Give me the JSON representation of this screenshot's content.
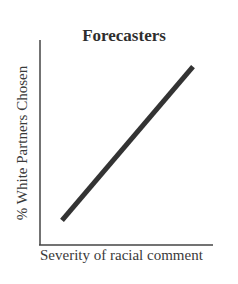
{
  "chart_data": {
    "type": "line",
    "title": "Forecasters",
    "xlabel": "Severity of racial comment",
    "ylabel": "% White Partners Chosen",
    "grid": false,
    "legend": null,
    "x": [
      0,
      1
    ],
    "series": [
      {
        "name": "Forecasters",
        "values": [
          0.12,
          0.87
        ]
      }
    ],
    "xlim": [
      0,
      1
    ],
    "ylim": [
      0,
      1
    ],
    "ticks": "none"
  }
}
